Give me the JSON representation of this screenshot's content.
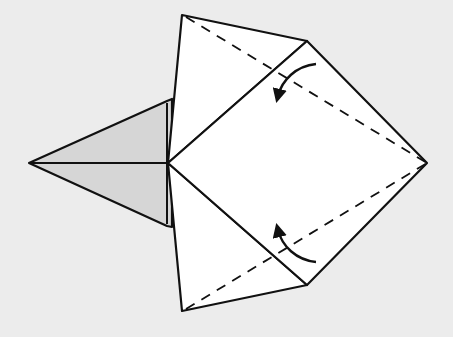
{
  "diagram": {
    "type": "origami-fold-step",
    "background_color": "#ececec",
    "paper_color": "#ffffff",
    "shaded_color": "#d6d6d6",
    "line_color": "#111111",
    "elements": {
      "left_flap": {
        "description": "shaded triangular point pointing left",
        "tip": [
          29,
          163
        ],
        "base_top": [
          167,
          101
        ],
        "base_bottom": [
          167,
          226
        ]
      },
      "upper_triangle": {
        "description": "upper white flap",
        "points": [
          [
            182,
            15
          ],
          [
            307,
            41
          ],
          [
            168,
            163
          ]
        ]
      },
      "lower_triangle": {
        "description": "lower white flap",
        "points": [
          [
            168,
            163
          ],
          [
            307,
            285
          ],
          [
            182,
            311
          ]
        ]
      },
      "square": {
        "description": "central diamond square",
        "points": [
          [
            168,
            163
          ],
          [
            307,
            41
          ],
          [
            427,
            163
          ],
          [
            307,
            285
          ]
        ]
      },
      "valley_fold_upper": {
        "description": "dashed valley fold line",
        "from": [
          186,
          17
        ],
        "to": [
          427,
          163
        ]
      },
      "valley_fold_lower": {
        "description": "dashed valley fold line",
        "from": [
          186,
          309
        ],
        "to": [
          427,
          163
        ]
      },
      "arrow_upper": {
        "description": "curved fold arrow pointing down-left",
        "direction": "fold-down"
      },
      "arrow_lower": {
        "description": "curved fold arrow pointing up-left",
        "direction": "fold-up"
      }
    }
  }
}
